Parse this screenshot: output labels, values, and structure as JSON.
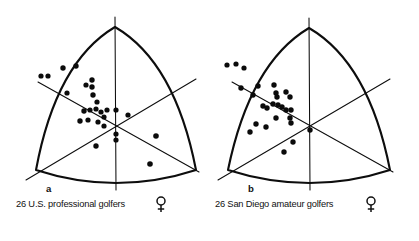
{
  "figure": {
    "title": "",
    "panels": [
      {
        "id": "a",
        "letter": "a",
        "caption": "26 U.S. professional golfers",
        "sex_symbol": "female-symbol",
        "n": 26,
        "geometry": {
          "apex": [
            115,
            27
          ],
          "left_corner": [
            36,
            170
          ],
          "right_corner": [
            196,
            170
          ],
          "center": [
            116,
            122
          ],
          "bulge": 0.31
        },
        "points": [
          [
            41,
            76
          ],
          [
            48,
            76
          ],
          [
            63,
            68
          ],
          [
            76,
            66
          ],
          [
            67,
            93
          ],
          [
            86,
            85
          ],
          [
            92,
            82
          ],
          [
            92,
            88
          ],
          [
            93,
            95
          ],
          [
            97,
            102
          ],
          [
            84,
            111
          ],
          [
            90,
            110
          ],
          [
            96,
            109
          ],
          [
            101,
            112
          ],
          [
            107,
            110
          ],
          [
            80,
            121
          ],
          [
            88,
            120
          ],
          [
            98,
            122
          ],
          [
            104,
            117
          ],
          [
            104,
            126
          ],
          [
            116,
            110
          ],
          [
            116,
            134
          ],
          [
            116,
            140
          ],
          [
            128,
            115
          ],
          [
            96,
            146
          ],
          [
            156,
            136
          ],
          [
            150,
            164
          ]
        ]
      },
      {
        "id": "b",
        "letter": "b",
        "caption": "26 San Diego amateur golfers",
        "sex_symbol": "female-symbol",
        "n": 26,
        "geometry": {
          "apex": [
            309,
            28
          ],
          "left_corner": [
            228,
            170
          ],
          "right_corner": [
            390,
            170
          ],
          "center": [
            310,
            122
          ],
          "bulge": 0.31
        },
        "points": [
          [
            226,
            65
          ],
          [
            235,
            64
          ],
          [
            243,
            68
          ],
          [
            241,
            88
          ],
          [
            258,
            86
          ],
          [
            253,
            95
          ],
          [
            273,
            86
          ],
          [
            275,
            94
          ],
          [
            278,
            96
          ],
          [
            276,
            100
          ],
          [
            285,
            93
          ],
          [
            289,
            97
          ],
          [
            272,
            104
          ],
          [
            277,
            105
          ],
          [
            281,
            107
          ],
          [
            285,
            110
          ],
          [
            290,
            110
          ],
          [
            262,
            106
          ],
          [
            266,
            108
          ],
          [
            275,
            118
          ],
          [
            289,
            118
          ],
          [
            255,
            124
          ],
          [
            265,
            127
          ],
          [
            249,
            132
          ],
          [
            290,
            123
          ],
          [
            309,
            130
          ],
          [
            292,
            142
          ],
          [
            283,
            152
          ]
        ]
      }
    ],
    "axes_note": "three-axis star through centroid",
    "colors": {
      "ink": "#0d0d0d",
      "background": "#ffffff"
    }
  }
}
